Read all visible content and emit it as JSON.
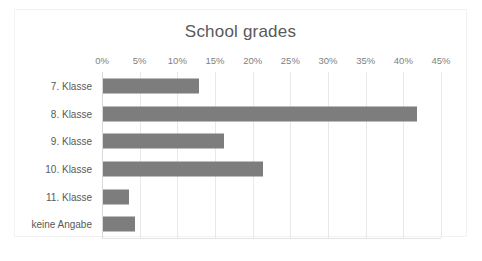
{
  "chart": {
    "title": "School grades",
    "frame_border_color": "#f2f2f2",
    "bar_color": "#7d7d7d",
    "gridline_color": "#e8e8e8",
    "tick_label_color": "#808080",
    "category_label_color": "#595959"
  },
  "chart_data": {
    "type": "bar",
    "orientation": "horizontal",
    "title": "School grades",
    "xlabel": "",
    "ylabel": "",
    "categories": [
      "7. Klasse",
      "8. Klasse",
      "9. Klasse",
      "10. Klasse",
      "11. Klasse",
      "keine Angabe"
    ],
    "values": [
      12.7,
      41.7,
      16.1,
      21.2,
      3.4,
      4.2
    ],
    "value_unit": "%",
    "xlim": [
      0,
      45
    ],
    "xticks": [
      0,
      5,
      10,
      15,
      20,
      25,
      30,
      35,
      40,
      45
    ],
    "xtick_labels": [
      "0%",
      "5%",
      "10%",
      "15%",
      "20%",
      "25%",
      "30%",
      "35%",
      "40%",
      "45%"
    ],
    "grid": "vertical",
    "legend": "none",
    "series": [
      {
        "name": "School grades",
        "values": [
          12.7,
          41.7,
          16.1,
          21.2,
          3.4,
          4.2
        ]
      }
    ]
  }
}
